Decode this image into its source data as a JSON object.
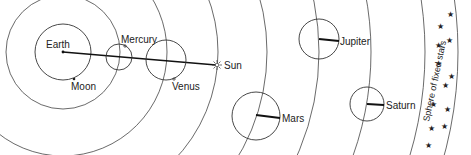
{
  "diagram": {
    "labels": {
      "earth": "Earth",
      "moon": "Moon",
      "mercury": "Mercury",
      "venus": "Venus",
      "sun": "Sun",
      "mars": "Mars",
      "jupiter": "Jupiter",
      "saturn": "Saturn",
      "sphere": "Sphere of fixed stars"
    },
    "star_glyph": "★",
    "colors": {
      "line": "#111111",
      "orbit": "#444444",
      "background": "#ffffff"
    }
  }
}
